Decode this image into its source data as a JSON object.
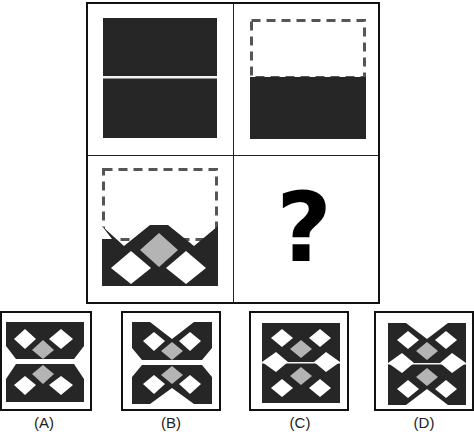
{
  "puzzle": {
    "question_mark": "?",
    "cells": [
      {
        "id": "cell-1",
        "description": "dark square split by thin white horizontal line"
      },
      {
        "id": "cell-2",
        "description": "dashed outline top half, dark bottom half"
      },
      {
        "id": "cell-3",
        "description": "dashed outline top, bottom half with lattice of white and gray diamonds"
      },
      {
        "id": "cell-4",
        "description": "question mark"
      }
    ],
    "colors": {
      "dark": "#262626",
      "gray_diamond": "#b4b4b4",
      "white": "#ffffff",
      "border": "#111111",
      "dash": "#555555"
    }
  },
  "options": [
    {
      "label": "(A)"
    },
    {
      "label": "(B)"
    },
    {
      "label": "(C)"
    },
    {
      "label": "(D)"
    }
  ]
}
